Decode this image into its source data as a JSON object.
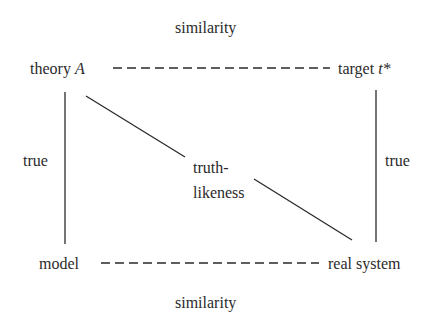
{
  "diagram": {
    "nodes": {
      "theory": {
        "text": "theory ",
        "var": "A"
      },
      "target": {
        "text": "target ",
        "var": "t*"
      },
      "model": {
        "text": "model"
      },
      "real_system": {
        "text": "real system"
      }
    },
    "edges": {
      "top_label": "similarity",
      "bottom_label": "similarity",
      "left_label": "true",
      "right_label": "true",
      "diagonal_label_line1": "truth-",
      "diagonal_label_line2": "likeness"
    },
    "colors": {
      "ink": "#2a2a2a",
      "background": "#ffffff"
    }
  }
}
